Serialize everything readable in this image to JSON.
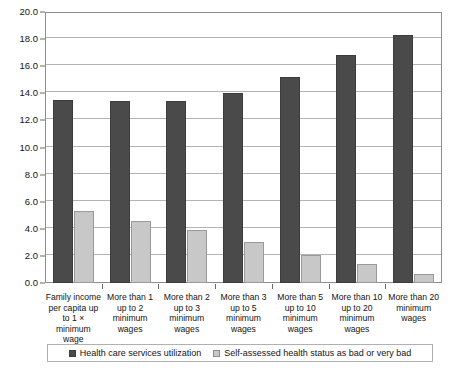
{
  "chart_data": {
    "type": "bar",
    "title": "",
    "xlabel": "",
    "ylabel": "",
    "ylim": [
      0.0,
      20.0
    ],
    "ytick_labels": [
      "0.0",
      "2.0",
      "4.0",
      "6.0",
      "8.0",
      "10.0",
      "12.0",
      "14.0",
      "16.0",
      "18.0",
      "20.0"
    ],
    "ytick_values": [
      0.0,
      2.0,
      4.0,
      6.0,
      8.0,
      10.0,
      12.0,
      14.0,
      16.0,
      18.0,
      20.0
    ],
    "grid": true,
    "legend_position": "bottom",
    "categories": [
      "Family income per capita up to 1 × minimum wage",
      "More than 1 up to 2 minimum wages",
      "More than 2 up to 3 minimum wages",
      "More than 3 up to 5 minimum wages",
      "More than 5 up to 10 minimum wages",
      "More than 10 up to 20 minimum wages",
      "More than 20 minimum wages"
    ],
    "series": [
      {
        "name": "Health care services utilization",
        "color": "#4a4a4a",
        "values": [
          13.5,
          13.4,
          13.4,
          14.0,
          15.2,
          16.8,
          18.3
        ]
      },
      {
        "name": "Self-assessed health status as bad or very bad",
        "color": "#c8c8c8",
        "values": [
          5.3,
          4.6,
          3.9,
          3.0,
          2.1,
          1.4,
          0.7
        ]
      }
    ]
  },
  "legend": {
    "entries": [
      {
        "label": "Health care services utilization",
        "swatch": "dark"
      },
      {
        "label": "Self-assessed health status as bad or very bad",
        "swatch": "light"
      }
    ]
  }
}
